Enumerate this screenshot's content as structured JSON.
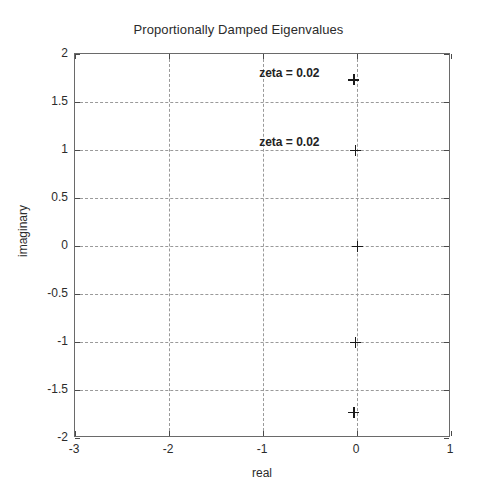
{
  "chart_data": {
    "type": "scatter",
    "title": "Proportionally Damped Eigenvalues",
    "xlabel": "real",
    "ylabel": "imaginary",
    "xlim": [
      -3,
      1
    ],
    "ylim": [
      -2,
      2
    ],
    "xticks": [
      -3,
      -2,
      -1,
      0,
      1
    ],
    "xticklabels": [
      "-3",
      "-2",
      "-1",
      "0",
      "1"
    ],
    "yticks": [
      -2,
      -1.5,
      -1,
      -0.5,
      0,
      0.5,
      1,
      1.5,
      2
    ],
    "yticklabels": [
      "-2",
      "-1.5",
      "-1",
      "-0.5",
      "0",
      "0.5",
      "1",
      "1.5",
      "2"
    ],
    "grid": true,
    "grid_style": "dashed",
    "legend": null,
    "marker": "+",
    "marker_color": "#1a1a1a",
    "series": [
      {
        "name": "eigenvalues",
        "points": [
          {
            "x": -0.035,
            "y": 1.73
          },
          {
            "x": -0.02,
            "y": 1.0
          },
          {
            "x": 0.0,
            "y": 0.0
          },
          {
            "x": -0.02,
            "y": -1.0
          },
          {
            "x": -0.035,
            "y": -1.73
          }
        ]
      }
    ],
    "annotations": [
      {
        "text": "zeta = 0.02",
        "x": -0.72,
        "y": 1.8
      },
      {
        "text": "zeta = 0.02",
        "x": -0.72,
        "y": 1.08
      }
    ]
  }
}
